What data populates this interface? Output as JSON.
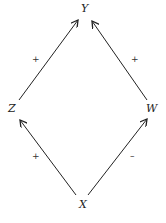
{
  "nodes": {
    "y": {
      "label": "Y"
    },
    "z": {
      "label": "Z"
    },
    "w": {
      "label": "W"
    },
    "x": {
      "label": "X"
    }
  },
  "edges": [
    {
      "from": "Z",
      "to": "Y",
      "sign": "+"
    },
    {
      "from": "W",
      "to": "Y",
      "sign": "+"
    },
    {
      "from": "X",
      "to": "Z",
      "sign": "+"
    },
    {
      "from": "X",
      "to": "W",
      "sign": "–"
    }
  ],
  "colors": {
    "line": "#222222",
    "background": "#ffffff"
  }
}
